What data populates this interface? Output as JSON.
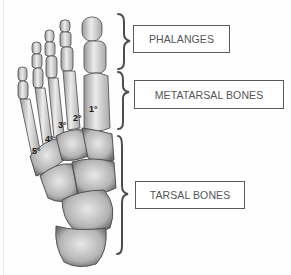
{
  "diagram": {
    "regions": [
      {
        "label": "PHALANGES"
      },
      {
        "label": "METATARSAL BONES"
      },
      {
        "label": "TARSAL BONES"
      }
    ],
    "metatarsal_numbers": [
      "1°",
      "2°",
      "3°",
      "4°",
      "5°"
    ],
    "colors": {
      "bone_light": "#e4e4e4",
      "bone_shadow": "#8a8a8a",
      "bone_outline": "#4a4a4a",
      "brace": "#4d4d4d",
      "box_border": "#5a5a5a",
      "label_text": "#555555"
    }
  }
}
